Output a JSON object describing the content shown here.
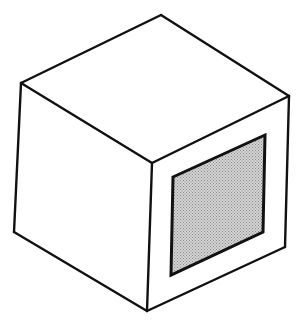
{
  "figure": {
    "faces": [
      "top-face",
      "left-face",
      "right-face"
    ],
    "panel": {
      "face": "right-face",
      "fill_pattern": "stippled",
      "fill_color": "#d4d4d4",
      "dot_color": "#8a8a8a"
    },
    "line_color": "#111111",
    "background_color": "#ffffff"
  }
}
